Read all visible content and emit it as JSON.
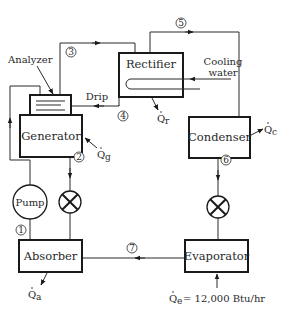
{
  "diagram": {
    "components": {
      "analyzer": "Analyzer",
      "generator": "Generator",
      "rectifier": "Rectifier",
      "condenser": "Condenser",
      "pump": "Pump",
      "absorber": "Absorber",
      "evaporator": "Evaporator"
    },
    "labels": {
      "drip": "Drip",
      "cooling_water_line1": "Cooling",
      "cooling_water_line2": "water"
    },
    "heat_flows": {
      "generator": {
        "symbol": "Q",
        "subscript": "g"
      },
      "rectifier": {
        "symbol": "Q",
        "subscript": "r"
      },
      "condenser": {
        "symbol": "Q",
        "subscript": "c"
      },
      "absorber": {
        "symbol": "Q",
        "subscript": "a"
      },
      "evaporator": {
        "symbol": "Q",
        "subscript": "e",
        "value_text": "= 12,000 Btu/hr"
      }
    },
    "state_points": [
      "1",
      "2",
      "3",
      "4",
      "5",
      "6",
      "7"
    ]
  }
}
